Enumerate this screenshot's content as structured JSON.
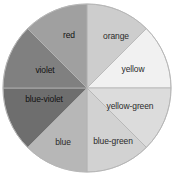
{
  "figure": {
    "name": "color-wheel",
    "type": "pie",
    "background": "#ffffff",
    "center_x": 87,
    "center_y": 88,
    "radius": 84,
    "stroke": "#b4b4b4",
    "stroke_width": 0.8
  },
  "chart_data": {
    "type": "pie",
    "title": "",
    "subtitle": "",
    "xlabel": "",
    "ylabel": "",
    "legend_position": "none",
    "grid": false,
    "note": "Grayscale reproduction of a twelve-part color wheel rendered with eight equal wedges; each wedge is labelled with its hue name and filled with the gray value of that hue.",
    "categories": [
      "orange",
      "yellow",
      "yellow-green",
      "blue-green",
      "blue",
      "blue-violet",
      "violet",
      "red"
    ],
    "values": [
      45,
      45,
      45,
      45,
      45,
      45,
      45,
      45
    ],
    "slices": [
      {
        "label": "orange",
        "value": 45,
        "start_angle": 0,
        "end_angle": 45,
        "color": "#cdcdcd",
        "label_x": 116,
        "label_y": 36,
        "label_tone": "light"
      },
      {
        "label": "yellow",
        "value": 45,
        "start_angle": 45,
        "end_angle": 90,
        "color": "#f1f1f1",
        "label_x": 133,
        "label_y": 69,
        "label_tone": "light"
      },
      {
        "label": "yellow-green",
        "value": 45,
        "start_angle": 90,
        "end_angle": 135,
        "color": "#dcdcdc",
        "label_x": 130,
        "label_y": 106,
        "label_tone": "light"
      },
      {
        "label": "blue-green",
        "value": 45,
        "start_angle": 135,
        "end_angle": 180,
        "color": "#d2d2d2",
        "label_x": 113,
        "label_y": 141,
        "label_tone": "light"
      },
      {
        "label": "blue",
        "value": 45,
        "start_angle": 180,
        "end_angle": 225,
        "color": "#b7b7b7",
        "label_x": 63,
        "label_y": 142,
        "label_tone": "light"
      },
      {
        "label": "blue-violet",
        "value": 45,
        "start_angle": 225,
        "end_angle": 270,
        "color": "#6e6e6e",
        "label_x": 44,
        "label_y": 99,
        "label_tone": "dark"
      },
      {
        "label": "violet",
        "value": 45,
        "start_angle": 270,
        "end_angle": 315,
        "color": "#808080",
        "label_x": 45,
        "label_y": 70,
        "label_tone": "dark"
      },
      {
        "label": "red",
        "value": 45,
        "start_angle": 315,
        "end_angle": 360,
        "color": "#a0a0a0",
        "label_x": 69,
        "label_y": 35,
        "label_tone": "dark"
      }
    ]
  }
}
